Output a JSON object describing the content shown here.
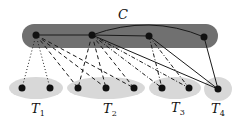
{
  "title": "C",
  "colors": {
    "clique_fill": "#707070",
    "group_fill": "#d8d8d8",
    "node": "#111111",
    "edge": "#1a1a1a"
  },
  "clique": {
    "label": "C",
    "nodes": [
      {
        "id": "c1",
        "x": 36,
        "y": 35
      },
      {
        "id": "c2",
        "x": 92,
        "y": 35
      },
      {
        "id": "c3",
        "x": 149,
        "y": 36
      },
      {
        "id": "c4",
        "x": 204,
        "y": 37
      }
    ]
  },
  "groups": [
    {
      "id": "T1",
      "label": "T",
      "sub": "1",
      "nodes": [
        {
          "x": 22,
          "y": 88
        },
        {
          "x": 50,
          "y": 88
        }
      ]
    },
    {
      "id": "T2",
      "label": "T",
      "sub": "2",
      "nodes": [
        {
          "x": 78,
          "y": 88
        },
        {
          "x": 106,
          "y": 88
        },
        {
          "x": 134,
          "y": 88
        }
      ]
    },
    {
      "id": "T3",
      "label": "T",
      "sub": "3",
      "nodes": [
        {
          "x": 162,
          "y": 88
        },
        {
          "x": 189,
          "y": 88
        }
      ]
    },
    {
      "id": "T4",
      "label": "T",
      "sub": "4",
      "nodes": [
        {
          "x": 218,
          "y": 89
        }
      ]
    }
  ],
  "edges": {
    "solid": [
      "c1-c2",
      "c2-c3",
      "c2~c4 (curve)",
      "c2-T4",
      "c3-T4",
      "c4-T4"
    ],
    "dotted": [
      "c1-T1a",
      "c1-T1b"
    ],
    "dashed": [
      "c1-T2a",
      "c1-T2b",
      "c1-T2c",
      "c2-T2a",
      "c2-T2b",
      "c2-T2c"
    ],
    "dashdot": [
      "c2-T3a",
      "c2-T3b",
      "c3-T3a",
      "c3-T3b"
    ]
  }
}
